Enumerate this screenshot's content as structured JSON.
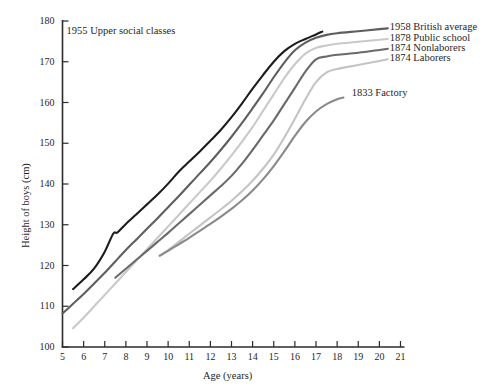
{
  "chart_data": {
    "type": "line",
    "title": "",
    "xlabel": "Age (years)",
    "ylabel": "Height of boys (cm)",
    "xlim": [
      5,
      21
    ],
    "ylim": [
      100,
      180
    ],
    "xticks": [
      5,
      6,
      7,
      8,
      9,
      10,
      11,
      12,
      13,
      14,
      15,
      16,
      17,
      18,
      19,
      20,
      21
    ],
    "yticks": [
      100,
      110,
      120,
      130,
      140,
      150,
      160,
      170,
      180
    ],
    "grid": false,
    "legend_position": "inline-right-of-line-ends",
    "series": [
      {
        "name": "1955 Upper social classes",
        "color": "#1c1c1c",
        "label_x": 10.35,
        "label_y": 177.2,
        "label_anchor": "end",
        "x": [
          5.5,
          6.0,
          6.5,
          7.0,
          7.4,
          7.6,
          8.0,
          8.5,
          9.0,
          9.5,
          10.0,
          10.5,
          11.0,
          11.5,
          12.0,
          12.5,
          13.0,
          13.5,
          14.0,
          14.5,
          15.0,
          15.5,
          16.0,
          16.5,
          17.0,
          17.3
        ],
        "y": [
          114.2,
          116.6,
          119.3,
          123.4,
          127.8,
          128.1,
          130.2,
          132.6,
          135.0,
          137.4,
          140.1,
          143.0,
          145.5,
          148.0,
          150.6,
          153.3,
          156.4,
          159.8,
          163.4,
          166.8,
          170.0,
          172.6,
          174.4,
          175.6,
          176.7,
          177.4
        ]
      },
      {
        "name": "1958 British average",
        "color": "#5e5e5e",
        "label_x": 20.3,
        "label_y": 178.2,
        "label_anchor": "start",
        "x": [
          5.0,
          5.5,
          6.0,
          6.5,
          7.0,
          7.5,
          8.0,
          8.5,
          9.0,
          9.5,
          10.0,
          10.5,
          11.0,
          11.5,
          12.0,
          12.5,
          13.0,
          13.5,
          14.0,
          14.5,
          15.0,
          15.5,
          16.0,
          16.5,
          17.0,
          17.5,
          18.0,
          19.0,
          20.0,
          20.4
        ],
        "y": [
          108.2,
          110.6,
          113.0,
          115.6,
          118.2,
          121.0,
          123.8,
          126.4,
          129.0,
          131.6,
          134.3,
          137.0,
          139.8,
          142.6,
          145.4,
          148.4,
          151.6,
          155.0,
          158.6,
          162.3,
          166.2,
          169.8,
          172.8,
          174.7,
          175.9,
          176.6,
          177.0,
          177.5,
          178.0,
          178.2
        ]
      },
      {
        "name": "1878 Public school",
        "color": "#c9c9c9",
        "label_x": 20.3,
        "label_y": 175.6,
        "label_anchor": "start",
        "x": [
          5.5,
          6.0,
          6.5,
          7.0,
          7.5,
          8.0,
          8.5,
          9.0,
          9.5,
          10.0,
          10.5,
          11.0,
          11.5,
          12.0,
          12.5,
          13.0,
          13.5,
          14.0,
          14.5,
          15.0,
          15.5,
          16.0,
          16.5,
          17.0,
          17.5,
          18.0,
          19.0,
          20.0,
          20.4
        ],
        "y": [
          104.6,
          107.2,
          110.0,
          112.8,
          115.6,
          118.4,
          121.2,
          124.0,
          126.8,
          129.6,
          132.4,
          135.2,
          138.0,
          140.8,
          143.8,
          147.0,
          150.4,
          154.0,
          158.0,
          162.0,
          166.0,
          169.4,
          172.0,
          173.4,
          174.0,
          174.4,
          174.9,
          175.4,
          175.6
        ]
      },
      {
        "name": "1874 Nonlaborers",
        "color": "#6a6a6a",
        "label_x": 20.3,
        "label_y": 173.2,
        "label_anchor": "start",
        "x": [
          7.5,
          8.0,
          8.5,
          9.0,
          9.5,
          10.0,
          10.5,
          11.0,
          11.5,
          12.0,
          12.5,
          13.0,
          13.5,
          14.0,
          14.5,
          15.0,
          15.5,
          16.0,
          16.5,
          17.0,
          17.5,
          18.0,
          19.0,
          20.0,
          20.4
        ],
        "y": [
          117.0,
          119.2,
          121.4,
          123.6,
          125.8,
          128.0,
          130.3,
          132.6,
          134.9,
          137.2,
          139.5,
          142.0,
          145.0,
          148.4,
          152.0,
          155.6,
          159.6,
          163.6,
          167.6,
          170.6,
          171.3,
          171.7,
          172.2,
          172.9,
          173.2
        ]
      },
      {
        "name": "1874 Laborers",
        "color": "#c4c4c4",
        "label_x": 20.3,
        "label_y": 170.6,
        "label_anchor": "start",
        "x": [
          9.6,
          10.0,
          10.5,
          11.0,
          11.5,
          12.0,
          12.5,
          13.0,
          13.5,
          14.0,
          14.5,
          15.0,
          15.5,
          16.0,
          16.5,
          17.0,
          17.5,
          18.0,
          19.0,
          20.0,
          20.4
        ],
        "y": [
          122.4,
          123.8,
          125.8,
          127.8,
          129.8,
          131.8,
          133.8,
          135.9,
          138.2,
          140.8,
          143.8,
          147.2,
          151.4,
          156.0,
          160.8,
          165.0,
          167.4,
          168.2,
          169.2,
          170.2,
          170.6
        ]
      },
      {
        "name": "1833 Factory",
        "color": "#8a8a8a",
        "label_x": 18.5,
        "label_y": 162.0,
        "label_anchor": "start",
        "x": [
          9.6,
          10.0,
          10.5,
          11.0,
          11.5,
          12.0,
          12.5,
          13.0,
          13.5,
          14.0,
          14.5,
          15.0,
          15.5,
          16.0,
          16.5,
          17.0,
          17.5,
          18.0,
          18.3
        ],
        "y": [
          122.4,
          123.6,
          125.2,
          126.8,
          128.5,
          130.2,
          132.0,
          133.9,
          136.0,
          138.4,
          141.2,
          144.4,
          148.0,
          151.8,
          155.2,
          157.8,
          159.6,
          160.8,
          161.2
        ]
      }
    ]
  },
  "axes": {
    "x_title": "Age (years)",
    "y_title": "Height of boys (cm)",
    "x_tick_labels": [
      "5",
      "6",
      "7",
      "8",
      "9",
      "10",
      "11",
      "12",
      "13",
      "14",
      "15",
      "16",
      "17",
      "18",
      "19",
      "20",
      "21"
    ],
    "y_tick_labels": [
      "100",
      "110",
      "120",
      "130",
      "140",
      "150",
      "160",
      "170",
      "180"
    ]
  },
  "labels": {
    "upper_social": "1955 Upper social classes",
    "british_average": "1958 British average",
    "public_school": "1878 Public school",
    "nonlaborers": "1874 Nonlaborers",
    "laborers": "1874 Laborers",
    "factory": "1833 Factory"
  },
  "colors": {
    "axis": "#2b2b2b",
    "text": "#1f1f1f",
    "background": "#ffffff"
  }
}
